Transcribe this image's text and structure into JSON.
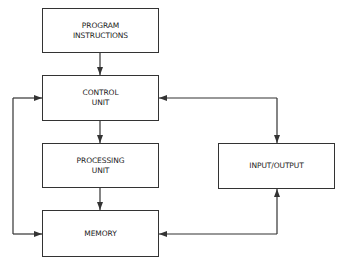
{
  "diagram": {
    "type": "block-diagram",
    "colors": {
      "line": "#333333",
      "text": "#222222",
      "background": "#ffffff"
    },
    "nodes": [
      {
        "id": "program",
        "lines": [
          "PROGRAM",
          "INSTRUCTIONS"
        ]
      },
      {
        "id": "control",
        "lines": [
          "CONTROL",
          "UNIT"
        ]
      },
      {
        "id": "processing",
        "lines": [
          "PROCESSING",
          "UNIT"
        ]
      },
      {
        "id": "memory",
        "lines": [
          "MEMORY"
        ]
      },
      {
        "id": "io",
        "lines": [
          "INPUT/OUTPUT"
        ]
      }
    ],
    "edges": [
      {
        "from": "program",
        "to": "control",
        "direction": "one-way"
      },
      {
        "from": "control",
        "to": "processing",
        "direction": "one-way"
      },
      {
        "from": "processing",
        "to": "memory",
        "direction": "one-way"
      },
      {
        "from": "control",
        "to": "memory",
        "direction": "bidirectional",
        "route": "left-loop"
      },
      {
        "from": "control",
        "to": "io",
        "direction": "bidirectional"
      },
      {
        "from": "memory",
        "to": "io",
        "direction": "bidirectional"
      }
    ]
  }
}
